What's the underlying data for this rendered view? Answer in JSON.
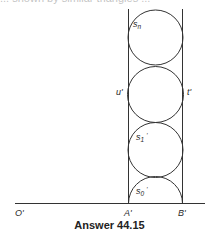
{
  "header": {
    "cut_off_text": "... shown by similar triangles ..."
  },
  "figure": {
    "caption": "Answer 44.15",
    "labels": {
      "s_n": "s",
      "s_n_sub": "n",
      "u_prime": "u'",
      "t_prime": "t'",
      "s1": "s",
      "s1_sub": "1",
      "s1_prime": "'",
      "s0": "s",
      "s0_sub": "0",
      "s0_prime": "'",
      "O_prime": "O'",
      "A_prime": "A'",
      "B_prime": "B'"
    },
    "colors": {
      "stroke": "#333333",
      "background": "#ffffff"
    }
  }
}
